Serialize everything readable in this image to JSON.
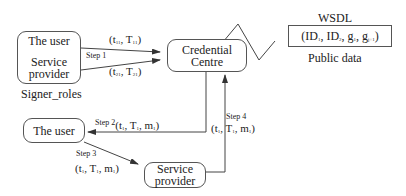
{
  "nodes": {
    "signer_box": {
      "line1": "The user",
      "line2": "Service",
      "line3": "provider",
      "caption": "Signer_roles"
    },
    "credential_centre": {
      "line1": "Credential",
      "line2": "Centre"
    },
    "wsdl": {
      "title": "WSDL",
      "content_prefix": "(ID",
      "id1_sub": "1",
      "sep1": ", ID",
      "id2_sub": "2",
      "sep2": ", g",
      "g1_sub": "1",
      "sep3": ", g",
      "g2_sub": "j+1",
      "close": ")",
      "caption": "Public data"
    },
    "user_box": {
      "label": "The user"
    },
    "service_provider_box": {
      "line1": "Service",
      "line2": "provider"
    }
  },
  "edges": {
    "step1": {
      "label": "Step 1",
      "upper_tuple": {
        "open": "(t",
        "sub_t": "11",
        "mid": ", T",
        "sub_T": "11",
        "close": ")"
      },
      "lower_tuple": {
        "open": "(t",
        "sub_t": "21",
        "mid": ", T",
        "sub_T": "21",
        "close": ")"
      }
    },
    "step2": {
      "label": "Step 2",
      "tuple": {
        "open": "(t",
        "sub_t": "1",
        "mid": ", T",
        "sub_T": "1",
        "mid2": ", m",
        "sub_m": "1",
        "close": ")"
      }
    },
    "step3": {
      "label": "Step 3",
      "tuple": {
        "open": "(t",
        "sub_t": "1",
        "mid": ", T",
        "sub_T": "1",
        "mid2": ", m",
        "sub_m": "1",
        "close": ")"
      }
    },
    "step4": {
      "label": "Step 4",
      "tuple": {
        "open": "(t",
        "sub_t": "1",
        "mid": ", T",
        "sub_T": "1",
        "mid2": ", m",
        "sub_m": "1",
        "close": ")"
      }
    }
  },
  "colors": {
    "line": "#444444",
    "text": "#222222",
    "background": "#ffffff"
  }
}
